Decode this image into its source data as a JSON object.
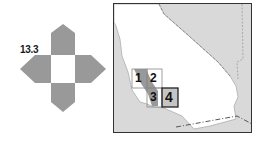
{
  "navigator": {
    "current_sheet": "13.3",
    "arrows": [
      "north",
      "south",
      "east",
      "west"
    ],
    "colors": {
      "arrow": "#999999",
      "center": "#ffffff"
    }
  },
  "locator_map": {
    "region": "California",
    "quadrangles": [
      {
        "id": "1",
        "label": "1",
        "selected": false
      },
      {
        "id": "2",
        "label": "2",
        "selected": false
      },
      {
        "id": "3",
        "label": "3",
        "selected": false
      },
      {
        "id": "4",
        "label": "4",
        "selected": true
      }
    ],
    "colors": {
      "land": "#ffffff",
      "outside": "#d9d9d9",
      "highlight": "#999999",
      "border": "#333333"
    }
  }
}
